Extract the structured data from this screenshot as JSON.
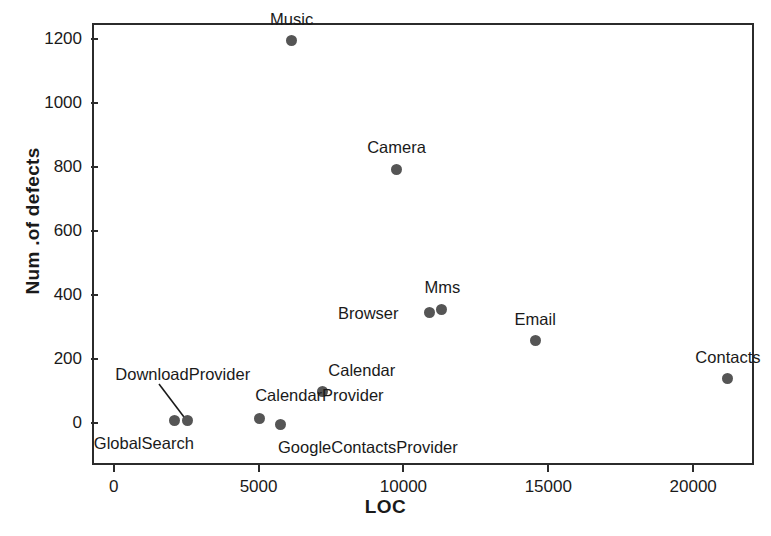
{
  "chart_data": {
    "type": "scatter",
    "title": "",
    "xlabel": "LOC",
    "ylabel": "Num .of defects",
    "xlim": [
      -750,
      22100
    ],
    "ylim": [
      -130,
      1250
    ],
    "grid": false,
    "legend": "none",
    "xticks": [
      0,
      5000,
      10000,
      15000,
      20000
    ],
    "xtick_labels": [
      "0",
      "5000",
      "10000",
      "15000",
      "20000"
    ],
    "yticks": [
      0,
      200,
      400,
      600,
      800,
      1000,
      1200
    ],
    "ytick_labels": [
      "0",
      "200",
      "400",
      "600",
      "800",
      "1000",
      "1200"
    ],
    "marker_color": "#555555",
    "frame_color": "#2b2b2b",
    "points": [
      {
        "name": "Music",
        "x": 6140,
        "y": 1194,
        "label": "Music",
        "label_dx": 0,
        "label_dy": -22,
        "label_align": "center",
        "leader": false
      },
      {
        "name": "Camera",
        "x": 9760,
        "y": 793,
        "label": "Camera",
        "label_dx": 0,
        "label_dy": -22,
        "label_align": "center",
        "leader": false
      },
      {
        "name": "Mms",
        "x": 11310,
        "y": 357,
        "label": "Mms",
        "label_dx": 1,
        "label_dy": -22,
        "label_align": "center",
        "leader": false
      },
      {
        "name": "Browser",
        "x": 10900,
        "y": 345,
        "label": "Browser",
        "label_dx": -31,
        "label_dy": 0,
        "label_align": "right",
        "leader": false
      },
      {
        "name": "Email",
        "x": 14550,
        "y": 258,
        "label": "Email",
        "label_dx": 0,
        "label_dy": -22,
        "label_align": "center",
        "leader": false
      },
      {
        "name": "Contacts",
        "x": 21200,
        "y": 140,
        "label": "Contacts",
        "label_dx": 0,
        "label_dy": -22,
        "label_align": "center",
        "leader": false
      },
      {
        "name": "Calendar",
        "x": 7200,
        "y": 98,
        "label": "Calendar",
        "label_dx": 6,
        "label_dy": -22,
        "label_align": "left",
        "leader": false
      },
      {
        "name": "GlobalSearch",
        "x": 2110,
        "y": 8,
        "label": "GlobalSearch",
        "label_dx": -81,
        "label_dy": 22,
        "label_align": "left",
        "leader": false
      },
      {
        "name": "DownloadProvider",
        "x": 2540,
        "y": 8,
        "label": "DownloadProvider",
        "label_dx": -72,
        "label_dy": -47,
        "label_align": "left",
        "leader": true,
        "leader_dx": -28,
        "leader_dy": -37
      },
      {
        "name": "CalendarProvider",
        "x": 5020,
        "y": 14,
        "label": "CalendarProvider",
        "label_dx": -4,
        "label_dy": -24,
        "label_align": "left",
        "leader": false
      },
      {
        "name": "GoogleContactsProvider",
        "x": 5740,
        "y": -3,
        "label": "GoogleContactsProvider",
        "label_dx": -2,
        "label_dy": 23,
        "label_align": "left",
        "leader": false
      }
    ]
  }
}
